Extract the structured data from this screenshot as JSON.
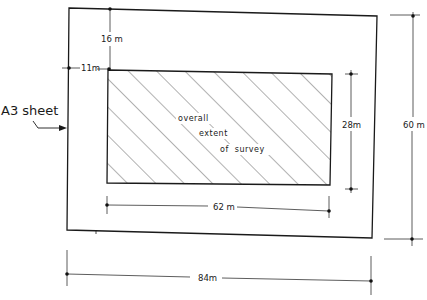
{
  "diagram": {
    "outer_label": "A3 sheet",
    "inner_label_lines": [
      "overall",
      "extent",
      "of  survey"
    ],
    "dimensions": {
      "top_margin": "16 m",
      "left_margin": "11m",
      "inner_height": "28m",
      "outer_height": "60 m",
      "inner_width": "62 m",
      "outer_width": "84m"
    },
    "colors": {
      "line": "#1a1a1a",
      "hatch": "#444444",
      "background": "#ffffff"
    }
  }
}
